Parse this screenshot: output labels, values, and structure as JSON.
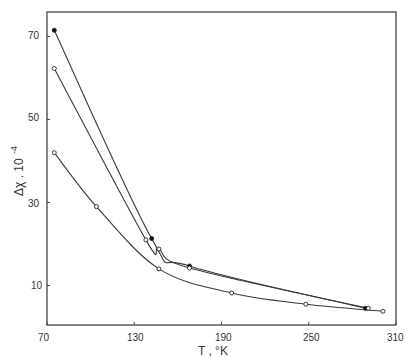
{
  "chart_data": {
    "type": "line",
    "title": "",
    "xlabel": "T , °K",
    "ylabel": "Δχ . 10⁻⁴",
    "xlim": [
      70,
      310
    ],
    "ylim": [
      0,
      75
    ],
    "x_ticks": [
      70,
      130,
      190,
      250,
      310
    ],
    "y_ticks": [
      10,
      30,
      50,
      70
    ],
    "grid": false,
    "legend": null,
    "series": [
      {
        "name": "filled markers (upper curve)",
        "marker": "filled",
        "points": [
          [
            75,
            71.5
          ],
          [
            142,
            21.3
          ],
          [
            168,
            14.7
          ],
          [
            289,
            4.5
          ]
        ]
      },
      {
        "name": "open markers (middle curve)",
        "marker": "open",
        "points": [
          [
            75,
            62.3
          ],
          [
            138,
            21.0
          ],
          [
            147,
            18.8
          ],
          [
            168,
            14.2
          ],
          [
            291,
            4.5
          ]
        ]
      },
      {
        "name": "open markers (lower curve)",
        "marker": "open",
        "points": [
          [
            75,
            42.0
          ],
          [
            104,
            29.0
          ],
          [
            147,
            14.0
          ],
          [
            197,
            8.2
          ],
          [
            248,
            5.5
          ],
          [
            301,
            3.8
          ]
        ]
      }
    ]
  },
  "axes": {
    "x_label": "T , °K",
    "y_label_main": "Δχ . 10",
    "y_label_exp": "-4",
    "x_tick_labels": [
      "70",
      "130",
      "190",
      "250",
      "310"
    ],
    "y_tick_labels": [
      "70",
      "50",
      "30",
      "10"
    ]
  },
  "style": {
    "line_color": "#3a3a3a",
    "axis_color": "#444444",
    "background": "#ffffff"
  }
}
